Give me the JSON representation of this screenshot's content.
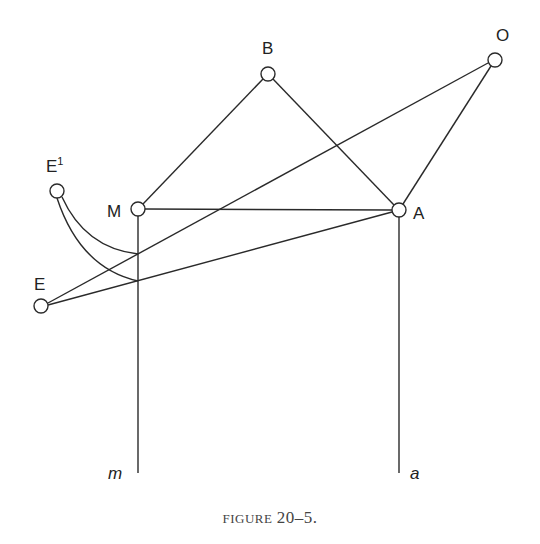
{
  "figure": {
    "caption_word": "FIGURE",
    "caption_number": "20–5.",
    "nodes": [
      {
        "id": "B",
        "label": "B",
        "x": 268,
        "y": 74
      },
      {
        "id": "O",
        "label": "O",
        "x": 495,
        "y": 60
      },
      {
        "id": "E1",
        "label": "E",
        "superscript": "1",
        "x": 57,
        "y": 191
      },
      {
        "id": "M",
        "label": "M",
        "x": 138,
        "y": 209
      },
      {
        "id": "A",
        "label": "A",
        "x": 399,
        "y": 210
      },
      {
        "id": "E",
        "label": "E",
        "x": 41,
        "y": 306
      }
    ],
    "edges": [
      {
        "from": "M",
        "to": "B"
      },
      {
        "from": "B",
        "to": "A"
      },
      {
        "from": "A",
        "to": "O"
      },
      {
        "from": "M",
        "to": "A"
      },
      {
        "from": "E",
        "to": "O"
      },
      {
        "from": "E",
        "to": "A"
      },
      {
        "from": "M",
        "to": "m-end",
        "note": "vertical line m"
      },
      {
        "from": "A",
        "to": "a-end",
        "note": "vertical line a"
      },
      {
        "from": "E1",
        "to": "curve-upper",
        "type": "curve"
      },
      {
        "from": "E1",
        "to": "curve-lower",
        "type": "curve"
      }
    ],
    "line_labels": {
      "m": "m",
      "a": "a"
    },
    "colors": {
      "stroke": "#2a2a2a",
      "background": "#ffffff",
      "caption": "#444444"
    }
  }
}
